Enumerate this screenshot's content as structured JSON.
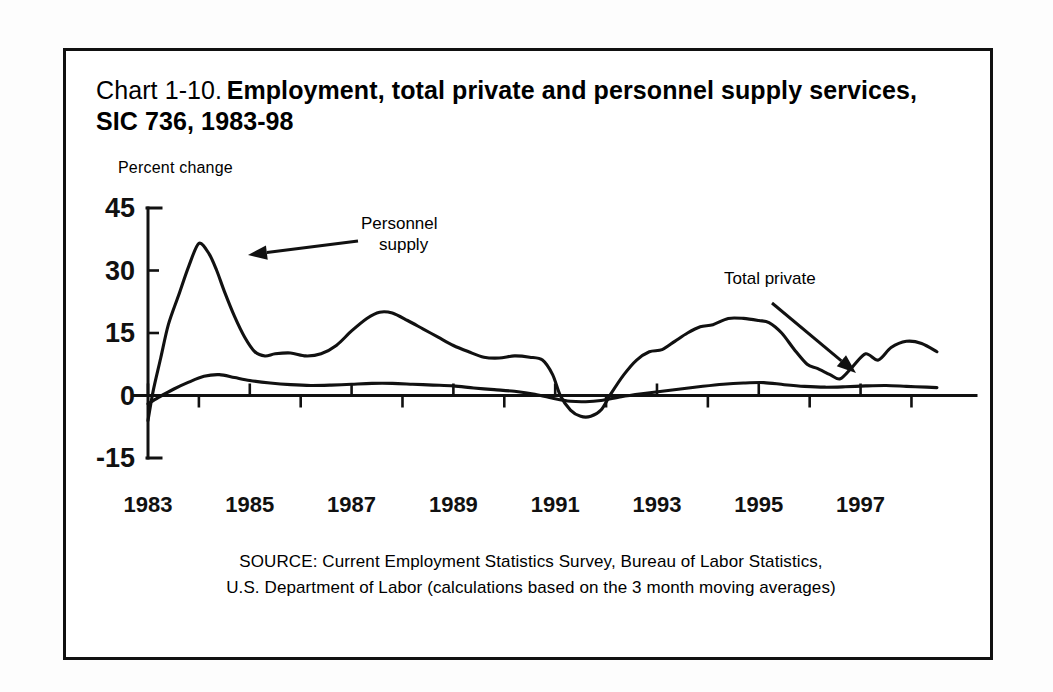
{
  "figure": {
    "label": "Chart 1-10.",
    "title": "Employment, total private and personnel supply services, SIC 736, 1983-98"
  },
  "source": {
    "line1": "SOURCE: Current Employment Statistics Survey, Bureau of Labor Statistics,",
    "line2": "U.S. Department of Labor (calculations based on the 3 month moving averages)"
  },
  "annotations": {
    "personnel_supply_line1": "Personnel",
    "personnel_supply_line2": "supply",
    "total_private": "Total private"
  },
  "colors": {
    "ink": "#111111",
    "paper": "#ffffff"
  },
  "chart_data": {
    "type": "line",
    "title": "Employment, total private and personnel supply services, SIC 736, 1983-98",
    "xlabel": "",
    "ylabel": "Percent change",
    "ylim": [
      -15,
      45
    ],
    "xlim": [
      1983,
      1998.6
    ],
    "yticks": [
      45,
      30,
      15,
      0,
      -15
    ],
    "ytick_labels": [
      "45",
      "30",
      "15",
      "0",
      "-15"
    ],
    "xticks": [
      1983,
      1985,
      1987,
      1989,
      1991,
      1993,
      1995,
      1997
    ],
    "xtick_labels": [
      "1983",
      "1985",
      "1987",
      "1989",
      "1991",
      "1993",
      "1995",
      "1997"
    ],
    "xminor_ticks": [
      1984,
      1986,
      1988,
      1990,
      1992,
      1994,
      1996,
      1998
    ],
    "grid": false,
    "legend": "annotated-arrows",
    "series": [
      {
        "name": "Personnel supply",
        "x": [
          1983.0,
          1983.1,
          1983.25,
          1983.4,
          1983.6,
          1983.8,
          1984.0,
          1984.2,
          1984.35,
          1984.5,
          1984.7,
          1984.9,
          1985.1,
          1985.3,
          1985.5,
          1985.8,
          1986.1,
          1986.4,
          1986.7,
          1987.0,
          1987.3,
          1987.55,
          1987.8,
          1988.1,
          1988.4,
          1988.7,
          1989.0,
          1989.3,
          1989.6,
          1989.9,
          1990.2,
          1990.5,
          1990.75,
          1990.95,
          1991.1,
          1991.3,
          1991.5,
          1991.7,
          1991.9,
          1992.1,
          1992.35,
          1992.6,
          1992.85,
          1993.1,
          1993.35,
          1993.6,
          1993.85,
          1994.1,
          1994.4,
          1994.7,
          1995.0,
          1995.2,
          1995.45,
          1995.7,
          1995.95,
          1996.15,
          1996.4,
          1996.6,
          1996.85,
          1997.1,
          1997.35,
          1997.6,
          1997.9,
          1998.2,
          1998.5
        ],
        "values": [
          -6.0,
          1.0,
          9.0,
          17.0,
          24.0,
          31.0,
          36.5,
          34.0,
          30.0,
          25.0,
          19.0,
          14.0,
          10.5,
          9.5,
          10.0,
          10.2,
          9.5,
          10.0,
          12.0,
          15.5,
          18.5,
          20.0,
          19.8,
          18.0,
          16.0,
          14.0,
          12.0,
          10.5,
          9.2,
          9.0,
          9.5,
          9.2,
          8.5,
          5.0,
          0.0,
          -3.5,
          -5.0,
          -5.0,
          -3.5,
          0.5,
          5.0,
          8.5,
          10.5,
          11.0,
          13.0,
          15.0,
          16.5,
          17.0,
          18.5,
          18.5,
          18.0,
          17.5,
          15.0,
          11.0,
          7.5,
          6.5,
          5.0,
          4.0,
          7.0,
          10.0,
          8.5,
          11.5,
          13.0,
          12.5,
          10.5
        ]
      },
      {
        "name": "Total private",
        "x": [
          1983.0,
          1983.2,
          1983.5,
          1983.8,
          1984.1,
          1984.4,
          1984.7,
          1985.0,
          1985.4,
          1985.8,
          1986.2,
          1986.6,
          1987.0,
          1987.4,
          1987.8,
          1988.2,
          1988.6,
          1989.0,
          1989.4,
          1989.8,
          1990.2,
          1990.6,
          1991.0,
          1991.3,
          1991.6,
          1991.9,
          1992.3,
          1992.7,
          1993.1,
          1993.5,
          1993.9,
          1994.3,
          1994.7,
          1995.1,
          1995.5,
          1995.9,
          1996.3,
          1996.7,
          1997.1,
          1997.5,
          1997.9,
          1998.3,
          1998.5
        ],
        "values": [
          -2.0,
          -0.5,
          1.5,
          3.2,
          4.6,
          5.0,
          4.3,
          3.6,
          3.0,
          2.6,
          2.4,
          2.5,
          2.7,
          2.9,
          2.9,
          2.7,
          2.5,
          2.3,
          1.8,
          1.4,
          1.0,
          0.3,
          -0.8,
          -1.4,
          -1.5,
          -1.2,
          -0.3,
          0.4,
          1.0,
          1.6,
          2.2,
          2.7,
          3.0,
          3.1,
          2.6,
          2.2,
          2.0,
          2.1,
          2.3,
          2.4,
          2.2,
          2.0,
          1.9
        ]
      }
    ]
  }
}
